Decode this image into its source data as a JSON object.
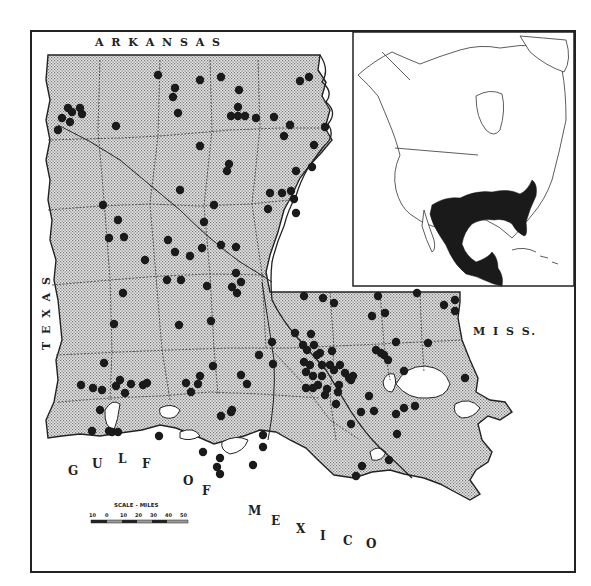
{
  "map": {
    "labels": {
      "arkansas": "A R K A N S A S",
      "texas": "T E X A S",
      "miss": "M I S S.",
      "gulf": [
        "G",
        "U",
        "L",
        "F"
      ],
      "of": [
        "O",
        "F"
      ],
      "mexico": [
        "M",
        "E",
        "X",
        "I",
        "C",
        "O"
      ]
    },
    "scale": {
      "title": "SCALE - MILES",
      "ticks": [
        "10",
        "0",
        "10",
        "20",
        "30",
        "40",
        "50"
      ]
    },
    "colors": {
      "land_fill": "#d4d4d4",
      "dot": "#1a1a1a",
      "border": "#222222",
      "range_fill": "#1a1a1a"
    },
    "inset": {
      "title": "North America range inset",
      "range_description": "Southeastern United States, Mexico and Central America shaded"
    },
    "occurrence_dots": [
      [
        68,
        108
      ],
      [
        62,
        118
      ],
      [
        72,
        112
      ],
      [
        80,
        108
      ],
      [
        82,
        114
      ],
      [
        70,
        122
      ],
      [
        58,
        130
      ],
      [
        116,
        126
      ],
      [
        158,
        75
      ],
      [
        175,
        88
      ],
      [
        200,
        80
      ],
      [
        221,
        77
      ],
      [
        173,
        97
      ],
      [
        178,
        113
      ],
      [
        239,
        90
      ],
      [
        238,
        107
      ],
      [
        231,
        116
      ],
      [
        238,
        116
      ],
      [
        245,
        116
      ],
      [
        256,
        118
      ],
      [
        274,
        117
      ],
      [
        290,
        125
      ],
      [
        284,
        136
      ],
      [
        300,
        81
      ],
      [
        309,
        77
      ],
      [
        325,
        127
      ],
      [
        314,
        145
      ],
      [
        312,
        167
      ],
      [
        200,
        146
      ],
      [
        229,
        164
      ],
      [
        227,
        171
      ],
      [
        296,
        171
      ],
      [
        270,
        193
      ],
      [
        282,
        193
      ],
      [
        291,
        191
      ],
      [
        294,
        199
      ],
      [
        268,
        209
      ],
      [
        296,
        213
      ],
      [
        214,
        205
      ],
      [
        204,
        222
      ],
      [
        103,
        205
      ],
      [
        118,
        220
      ],
      [
        124,
        237
      ],
      [
        180,
        190
      ],
      [
        202,
        248
      ],
      [
        168,
        240
      ],
      [
        221,
        245
      ],
      [
        236,
        247
      ],
      [
        109,
        238
      ],
      [
        145,
        260
      ],
      [
        175,
        252
      ],
      [
        190,
        256
      ],
      [
        236,
        273
      ],
      [
        232,
        287
      ],
      [
        241,
        282
      ],
      [
        167,
        280
      ],
      [
        181,
        280
      ],
      [
        207,
        286
      ],
      [
        237,
        293
      ],
      [
        123,
        293
      ],
      [
        114,
        324
      ],
      [
        104,
        363
      ],
      [
        93,
        388
      ],
      [
        81,
        385
      ],
      [
        102,
        390
      ],
      [
        120,
        380
      ],
      [
        116,
        386
      ],
      [
        131,
        384
      ],
      [
        125,
        393
      ],
      [
        147,
        383
      ],
      [
        143,
        385
      ],
      [
        179,
        325
      ],
      [
        211,
        321
      ],
      [
        213,
        366
      ],
      [
        241,
        375
      ],
      [
        247,
        384
      ],
      [
        200,
        376
      ],
      [
        186,
        383
      ],
      [
        198,
        384
      ],
      [
        191,
        392
      ],
      [
        231,
        412
      ],
      [
        221,
        416
      ],
      [
        232,
        410
      ],
      [
        272,
        342
      ],
      [
        259,
        355
      ],
      [
        273,
        364
      ],
      [
        304,
        296
      ],
      [
        323,
        298
      ],
      [
        334,
        303
      ],
      [
        378,
        296
      ],
      [
        417,
        293
      ],
      [
        385,
        313
      ],
      [
        372,
        316
      ],
      [
        311,
        334
      ],
      [
        295,
        333
      ],
      [
        303,
        345
      ],
      [
        314,
        345
      ],
      [
        307,
        350
      ],
      [
        320,
        353
      ],
      [
        317,
        355
      ],
      [
        332,
        351
      ],
      [
        304,
        362
      ],
      [
        310,
        365
      ],
      [
        322,
        365
      ],
      [
        330,
        365
      ],
      [
        340,
        365
      ],
      [
        306,
        372
      ],
      [
        313,
        376
      ],
      [
        322,
        376
      ],
      [
        334,
        370
      ],
      [
        318,
        385
      ],
      [
        306,
        388
      ],
      [
        313,
        388
      ],
      [
        327,
        389
      ],
      [
        345,
        373
      ],
      [
        349,
        378
      ],
      [
        353,
        376
      ],
      [
        339,
        385
      ],
      [
        351,
        380
      ],
      [
        376,
        350
      ],
      [
        381,
        353
      ],
      [
        384,
        355
      ],
      [
        388,
        360
      ],
      [
        396,
        342
      ],
      [
        404,
        371
      ],
      [
        369,
        396
      ],
      [
        325,
        395
      ],
      [
        338,
        392
      ],
      [
        336,
        404
      ],
      [
        374,
        411
      ],
      [
        351,
        424
      ],
      [
        361,
        412
      ],
      [
        396,
        414
      ],
      [
        404,
        408
      ],
      [
        415,
        406
      ],
      [
        397,
        434
      ],
      [
        444,
        305
      ],
      [
        455,
        300
      ],
      [
        455,
        311
      ],
      [
        428,
        343
      ],
      [
        465,
        378
      ],
      [
        389,
        460
      ],
      [
        362,
        466
      ],
      [
        356,
        476
      ],
      [
        263,
        435
      ],
      [
        263,
        447
      ],
      [
        253,
        465
      ],
      [
        100,
        410
      ],
      [
        92,
        431
      ],
      [
        109,
        431
      ],
      [
        112,
        432
      ],
      [
        118,
        432
      ],
      [
        159,
        436
      ],
      [
        203,
        452
      ],
      [
        220,
        458
      ],
      [
        217,
        467
      ],
      [
        220,
        474
      ]
    ]
  }
}
